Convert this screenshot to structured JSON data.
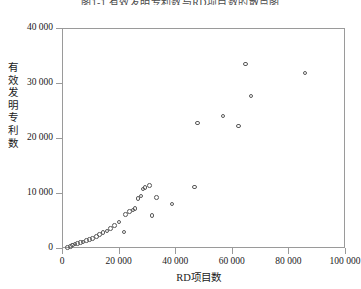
{
  "top_caption": "图1-1  有效发明专利数与RD项目数的散点图",
  "chart_data": {
    "type": "scatter",
    "title": "",
    "xlabel": "RD项目数",
    "ylabel": "有效发明专利数",
    "xlim": [
      0,
      100000
    ],
    "ylim": [
      0,
      40000
    ],
    "xticks": [
      0,
      20000,
      40000,
      60000,
      80000,
      100000
    ],
    "yticks": [
      0,
      10000,
      20000,
      30000,
      40000
    ],
    "xtick_labels": [
      "0",
      "20 000",
      "40 000",
      "60 000",
      "80 000",
      "100 000"
    ],
    "ytick_labels": [
      "0",
      "10 000",
      "20 000",
      "30 000",
      "40 000"
    ],
    "grid": false,
    "legend": null,
    "marker": "open-circle",
    "marker_color": "#595959",
    "points": [
      [
        1500,
        300
      ],
      [
        2600,
        500
      ],
      [
        3400,
        700
      ],
      [
        4200,
        900
      ],
      [
        5200,
        1000
      ],
      [
        6100,
        1200
      ],
      [
        7000,
        1300
      ],
      [
        8200,
        1500
      ],
      [
        9400,
        1700
      ],
      [
        10500,
        1900
      ],
      [
        11800,
        2300
      ],
      [
        13000,
        2600
      ],
      [
        14200,
        3000
      ],
      [
        15500,
        3300
      ],
      [
        16800,
        3700
      ],
      [
        18200,
        4300
      ],
      [
        19800,
        4900
      ],
      [
        21500,
        3100
      ],
      [
        22000,
        6300
      ],
      [
        23500,
        6800
      ],
      [
        24800,
        7100
      ],
      [
        25500,
        7400
      ],
      [
        26500,
        9200
      ],
      [
        27500,
        9600
      ],
      [
        28200,
        10900
      ],
      [
        29000,
        11200
      ],
      [
        30500,
        11500
      ],
      [
        31500,
        6100
      ],
      [
        33000,
        9400
      ],
      [
        38500,
        8200
      ],
      [
        46500,
        11300
      ],
      [
        47500,
        22900
      ],
      [
        56500,
        24200
      ],
      [
        62000,
        22400
      ],
      [
        64500,
        33600
      ],
      [
        66500,
        27800
      ],
      [
        85500,
        32000
      ]
    ]
  }
}
